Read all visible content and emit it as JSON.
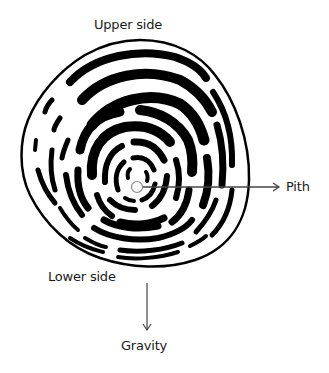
{
  "diagram": {
    "labels": {
      "upper": "Upper side",
      "pith": "Pith",
      "lower": "Lower side",
      "gravity": "Gravity"
    },
    "colors": {
      "ink": "#000000",
      "arrow": "#444444",
      "pith_outline": "#8a8a8a",
      "background": "#ffffff"
    },
    "icons": {
      "pith_arrow": "right-arrow",
      "gravity_arrow": "down-arrow"
    }
  }
}
